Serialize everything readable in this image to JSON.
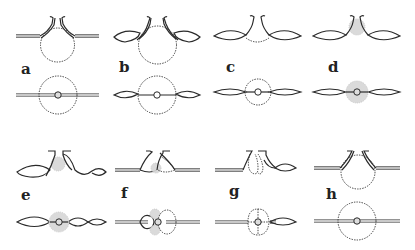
{
  "figure": {
    "panels": [
      {
        "label": "a",
        "side": "rounded sphere beneath a neck with flared lips; straight double-line layer",
        "top": "dashed circle with small grey central dot on straight double line"
      },
      {
        "label": "b",
        "side": "sphere with neck; layer swollen into lens shapes on both sides",
        "top": "dashed circle, white central dot, lens-shaped swellings on both sides"
      },
      {
        "label": "c",
        "side": "shallow dashed cavity between two lens-shaped swellings",
        "top": "dashed circle smaller, white central dot, lens swellings"
      },
      {
        "label": "d",
        "side": "stippled (grey) mass at neck between lens swellings",
        "top": "stippled grey disc around central dot with lens swellings"
      },
      {
        "label": "e",
        "side": "stippled mass at neck, asymmetric swellings",
        "top": "stippled disc, multiple lens swellings"
      },
      {
        "label": "f",
        "side": "two lobes: solid left, dashed right, stippled at neck; straight double layer",
        "top": "stippled lobes left, dashed lobe right, central dot"
      },
      {
        "label": "g",
        "side": "two dashed lobes under neck, lens swelling to right",
        "top": "four-lobed dashed structure with central dot, lens swelling right"
      },
      {
        "label": "h",
        "side": "dashed sphere beneath neck; straight double layer",
        "top": "dashed circle with grey central dot"
      }
    ]
  },
  "labels": {
    "a": "a",
    "b": "b",
    "c": "c",
    "d": "d",
    "e": "e",
    "f": "f",
    "g": "g",
    "h": "h"
  }
}
